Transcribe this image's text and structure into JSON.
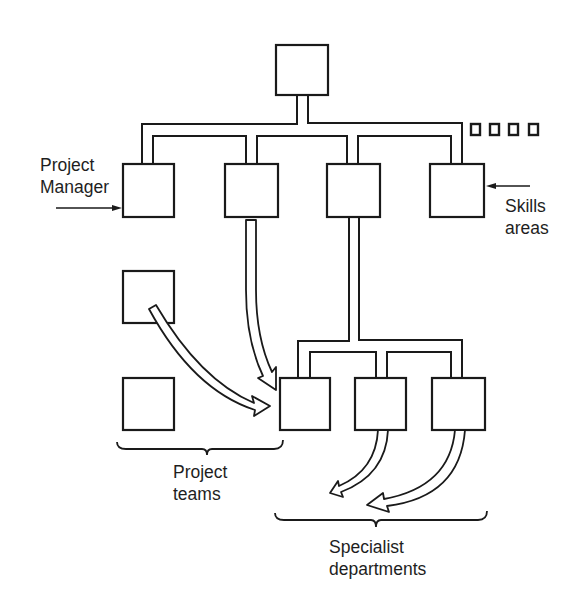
{
  "diagram": {
    "type": "organization-structure",
    "colors": {
      "ink": "#1a1a1a",
      "background": "#ffffff"
    },
    "labels": {
      "project_manager": {
        "line1": "Project",
        "line2": "Manager"
      },
      "skills_areas": {
        "line1": "Skills",
        "line2": "areas"
      },
      "project_teams": {
        "line1": "Project",
        "line2": "teams"
      },
      "specialist_departments": {
        "line1": "Specialist",
        "line2": "departments"
      }
    },
    "nodes": [
      {
        "id": "top",
        "role": "senior management"
      },
      {
        "id": "skills-1",
        "role": "skills area (project manager)"
      },
      {
        "id": "skills-2",
        "role": "skills area"
      },
      {
        "id": "skills-3",
        "role": "skills area"
      },
      {
        "id": "skills-4",
        "role": "skills area"
      },
      {
        "id": "more-skills",
        "role": "further skills areas (4 small squares)"
      },
      {
        "id": "team-1",
        "role": "project team"
      },
      {
        "id": "team-2",
        "role": "project team"
      },
      {
        "id": "team-3",
        "role": "project team"
      },
      {
        "id": "dept-1",
        "role": "specialist department"
      },
      {
        "id": "dept-2",
        "role": "specialist department"
      }
    ],
    "flows": [
      {
        "from": "skills-2",
        "to": "team-3",
        "style": "hollow arrow"
      },
      {
        "from": "team-1",
        "to": "team-3",
        "style": "hollow arrow"
      },
      {
        "from": "dept-1",
        "to": "specialist departments",
        "style": "hollow arrow"
      },
      {
        "from": "dept-2",
        "to": "specialist departments",
        "style": "hollow arrow"
      }
    ]
  }
}
